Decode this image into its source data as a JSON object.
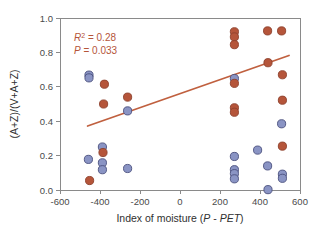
{
  "chart_data": {
    "type": "scatter",
    "title": "",
    "xlabel": "Index of moisture (P - PET)",
    "ylabel": "(A+Z)/(V+A+Z)",
    "xlim": [
      -600,
      600
    ],
    "ylim": [
      0.0,
      1.0
    ],
    "xticks": [
      -600,
      -400,
      -200,
      0,
      200,
      400,
      600
    ],
    "xtick_labels": [
      "-600",
      "-400",
      "-200",
      "0",
      "200",
      "400",
      "600"
    ],
    "yticks": [
      0.0,
      0.2,
      0.4,
      0.6,
      0.8,
      1.0
    ],
    "ytick_labels": [
      "0.0",
      "0.2",
      "0.4",
      "0.6",
      "0.8",
      "1.0"
    ],
    "grid": false,
    "legend": "none",
    "annotations": [
      {
        "name": "r-squared",
        "text": "R2 = 0.28",
        "value": 0.28,
        "color": "#b5553a"
      },
      {
        "name": "p-value",
        "text": "P = 0.033",
        "value": 0.033,
        "color": "#b5553a"
      }
    ],
    "series": [
      {
        "name": "orange-group",
        "color": "#b5553a",
        "edge_color": "#8c3f2b",
        "marker": "circle",
        "points": [
          {
            "x": -452,
            "y": 0.055
          },
          {
            "x": -385,
            "y": 0.218
          },
          {
            "x": -382,
            "y": 0.5
          },
          {
            "x": -378,
            "y": 0.615
          },
          {
            "x": -262,
            "y": 0.54
          },
          {
            "x": 272,
            "y": 0.92
          },
          {
            "x": 272,
            "y": 0.89
          },
          {
            "x": 272,
            "y": 0.845
          },
          {
            "x": 272,
            "y": 0.62
          },
          {
            "x": 272,
            "y": 0.478
          },
          {
            "x": 272,
            "y": 0.452
          },
          {
            "x": 438,
            "y": 0.925
          },
          {
            "x": 440,
            "y": 0.74
          },
          {
            "x": 508,
            "y": 0.925
          },
          {
            "x": 512,
            "y": 0.67
          },
          {
            "x": 512,
            "y": 0.522
          },
          {
            "x": 512,
            "y": 0.255
          }
        ]
      },
      {
        "name": "blue-group",
        "color": "#8a94c4",
        "edge_color": "#4a4f7d",
        "marker": "circle",
        "points": [
          {
            "x": -455,
            "y": 0.668
          },
          {
            "x": -455,
            "y": 0.652
          },
          {
            "x": -458,
            "y": 0.178
          },
          {
            "x": -388,
            "y": 0.25
          },
          {
            "x": -388,
            "y": 0.158
          },
          {
            "x": -388,
            "y": 0.118
          },
          {
            "x": -262,
            "y": 0.46
          },
          {
            "x": -262,
            "y": 0.125
          },
          {
            "x": 272,
            "y": 0.648
          },
          {
            "x": 272,
            "y": 0.195
          },
          {
            "x": 272,
            "y": 0.118
          },
          {
            "x": 272,
            "y": 0.095
          },
          {
            "x": 272,
            "y": 0.065
          },
          {
            "x": 388,
            "y": 0.232
          },
          {
            "x": 438,
            "y": 0.14
          },
          {
            "x": 440,
            "y": 0.002
          },
          {
            "x": 508,
            "y": 0.385
          },
          {
            "x": 512,
            "y": 0.092
          },
          {
            "x": 512,
            "y": 0.068
          }
        ]
      }
    ],
    "fit_line": {
      "name": "regression-line",
      "color": "#c0603f",
      "x_start": -462,
      "y_start": 0.372,
      "x_end": 545,
      "y_end": 0.782
    }
  }
}
